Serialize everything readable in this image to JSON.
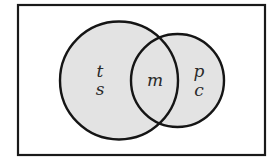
{
  "diagram": {
    "type": "venn",
    "universe": {
      "shape": "rectangle",
      "x1": 18,
      "y1": 5,
      "x2": 265,
      "y2": 155,
      "fill": "#ffffff",
      "stroke": "#1a1a1a"
    },
    "sets": [
      {
        "id": "left-set",
        "cx": 119,
        "cy": 80.5,
        "r": 59,
        "fill": "#e3e3e3",
        "stroke": "#151515",
        "exclusive_labels": [
          "t",
          "s"
        ]
      },
      {
        "id": "right-set",
        "cx": 177.5,
        "cy": 80.5,
        "r": 46.5,
        "fill": "#e3e3e3",
        "stroke": "#151515",
        "exclusive_labels": [
          "p",
          "c"
        ]
      }
    ],
    "intersection_labels": [
      "m"
    ],
    "labels": {
      "left_top": "t",
      "left_bottom": "s",
      "middle": "m",
      "right_top": "p",
      "right_bottom": "c"
    }
  }
}
